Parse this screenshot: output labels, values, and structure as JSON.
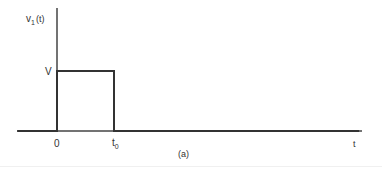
{
  "chart_data": {
    "type": "line",
    "title": "",
    "caption": "(a)",
    "ylabel": "v",
    "ylabel_subscript": "1",
    "ylabel_arg": "(t)",
    "xlabel": "t",
    "level_label": "V",
    "tick_labels": {
      "origin": "0",
      "end": "t",
      "end_subscript": "0"
    },
    "series": [
      {
        "name": "v1(t)",
        "points": [
          [
            -0.7,
            0
          ],
          [
            0,
            0
          ],
          [
            0,
            1
          ],
          [
            1,
            1
          ],
          [
            1,
            0
          ],
          [
            5.3,
            0
          ]
        ]
      }
    ],
    "xlim": [
      -0.7,
      5.3
    ],
    "ylim": [
      0,
      2.1
    ],
    "grid": false,
    "color": "#333333"
  }
}
